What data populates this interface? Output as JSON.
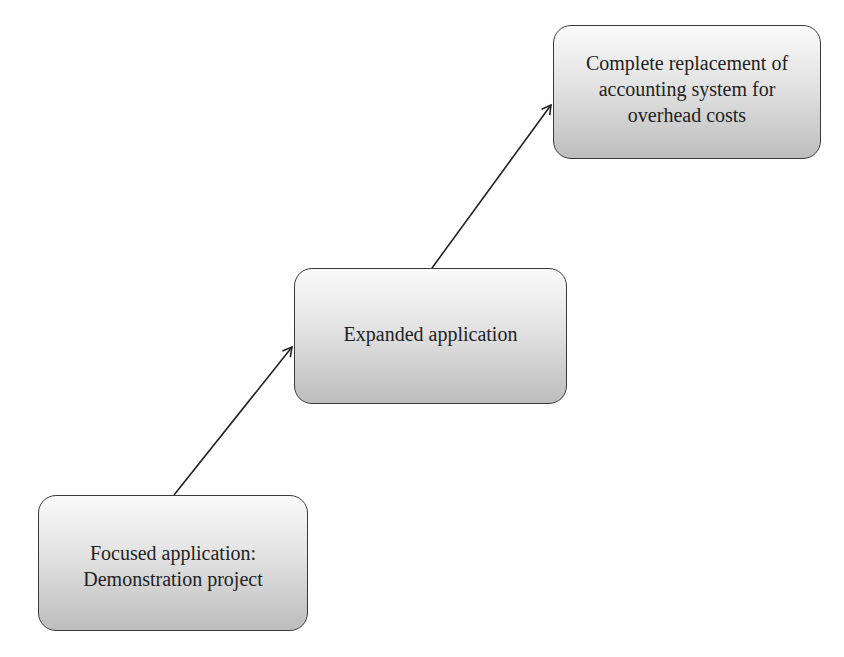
{
  "diagram": {
    "type": "staircase-flow",
    "nodes": [
      {
        "id": "focused",
        "lines": [
          "Focused application:",
          "Demonstration project"
        ]
      },
      {
        "id": "expanded",
        "lines": [
          "Expanded application"
        ]
      },
      {
        "id": "complete",
        "lines": [
          "Complete replacement of",
          "accounting system for",
          "overhead costs"
        ]
      }
    ],
    "edges": [
      {
        "from": "focused",
        "to": "expanded"
      },
      {
        "from": "expanded",
        "to": "complete"
      }
    ],
    "colors": {
      "box_border": "#3a3a3a",
      "box_fill_top": "#fafafa",
      "box_fill_bottom": "#bdbdbd",
      "arrow": "#222222",
      "text": "#222222"
    }
  }
}
